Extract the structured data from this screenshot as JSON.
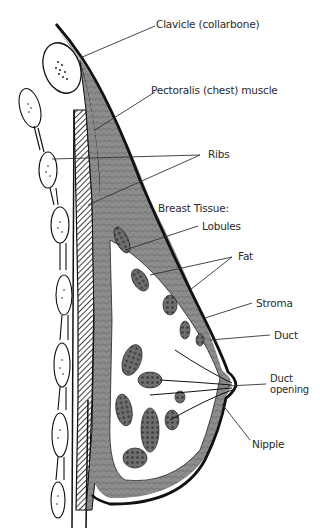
{
  "diagram": {
    "colors": {
      "ink": "#111111",
      "tissue": "#8a8a8a",
      "dark_tissue": "#5a5a5a",
      "background": "#ffffff"
    },
    "labels": {
      "clavicle": "Clavicle (collarbone)",
      "pectoralis": "Pectoralis (chest) muscle",
      "ribs": "Ribs",
      "breast_tissue": "Breast Tissue:",
      "lobules": "Lobules",
      "fat": "Fat",
      "stroma": "Stroma",
      "duct": "Duct",
      "duct_opening_line1": "Duct",
      "duct_opening_line2": "opening",
      "nipple": "Nipple"
    }
  }
}
